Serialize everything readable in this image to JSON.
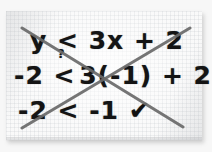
{
  "scene": {
    "kind": "photo-of-handwritten-math-worksheet",
    "paper_color": "#fafafa",
    "ink_color": "#141414",
    "strikethrough_color": "#6a6a6a"
  },
  "worksheet": {
    "lines": [
      {
        "id": "line-1",
        "text": "y < 3x + 2",
        "role": "original-inequality"
      },
      {
        "id": "line-2",
        "left": "-2",
        "operator": "<",
        "operator_annotation": "?",
        "right": "3(-1) + 2",
        "role": "substitution-check"
      },
      {
        "id": "line-3",
        "left": "-2",
        "operator": "<",
        "right": "-1",
        "mark": "✔",
        "role": "result-true"
      }
    ]
  },
  "annotations": {
    "strikethrough": {
      "shape": "X",
      "stroke_color": "#6a6a6a",
      "stroke_width": 3,
      "stroke_1": {
        "x1": 22,
        "y1": 28,
        "x2": 183,
        "y2": 127
      },
      "stroke_2": {
        "x1": 190,
        "y1": 28,
        "x2": 22,
        "y2": 128
      }
    }
  }
}
